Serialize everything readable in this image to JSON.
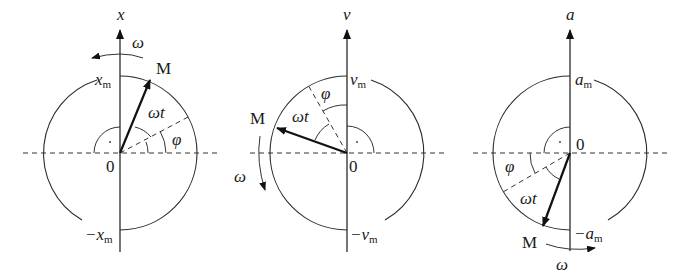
{
  "figure": {
    "panels": [
      {
        "id": "displacement",
        "axis_label": "x",
        "max_label_var": "x",
        "max_label_sub": "m",
        "min_label_var": "−x",
        "min_label_sub": "m",
        "origin_label": "0",
        "point_label": "M",
        "omega_label": "ω",
        "omega_t_label": "ωt",
        "phi_label": "φ"
      },
      {
        "id": "velocity",
        "axis_label": "v",
        "max_label_var": "v",
        "max_label_sub": "m",
        "min_label_var": "−v",
        "min_label_sub": "m",
        "origin_label": "0",
        "point_label": "M",
        "omega_label": "ω",
        "omega_t_label": "ωt",
        "phi_label": "φ"
      },
      {
        "id": "acceleration",
        "axis_label": "a",
        "max_label_var": "a",
        "max_label_sub": "m",
        "min_label_var": "−a",
        "min_label_sub": "m",
        "origin_label": "0",
        "point_label": "M",
        "omega_label": "ω",
        "omega_t_label": "ωt",
        "phi_label": "φ"
      }
    ]
  }
}
